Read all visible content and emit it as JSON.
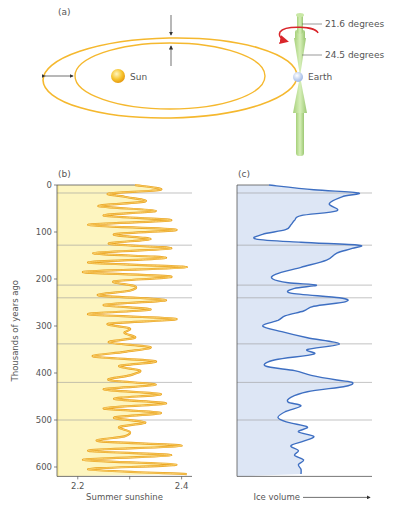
{
  "panel_a": {
    "label": "(a)",
    "sun_label": "Sun",
    "earth_label": "Earth",
    "tilt_max_label": "21.6 degrees",
    "tilt_min_label": "24.5 degrees",
    "colors": {
      "orbit": "#f5b82e",
      "sun": "#f7c530",
      "earth": "#c8d8f2",
      "axis": "#b6dc8c",
      "precession_arrow": "#d9252a"
    }
  },
  "panel_b": {
    "label": "(b)"
  },
  "panel_c": {
    "label": "(c)"
  },
  "chart_data": [
    {
      "type": "line",
      "title": "(b) Summer sunshine",
      "xlabel": "Summer sunshine",
      "ylabel": "Thousands of years ago",
      "xticks": [
        "2.2",
        "2.4"
      ],
      "xlim": [
        2.16,
        2.42
      ],
      "yticks": [
        0,
        100,
        200,
        300,
        400,
        500,
        600
      ],
      "ylim": [
        0,
        620
      ],
      "y_inverted": true,
      "fill_color": "#fdf5c0",
      "line_color": "#f2b23a",
      "reference_lines_kyr": [
        17,
        128,
        213,
        240,
        338,
        420,
        500
      ],
      "series": [
        {
          "name": "Summer sunshine",
          "y": [
            0,
            10,
            18,
            25,
            35,
            45,
            55,
            65,
            75,
            85,
            95,
            105,
            115,
            125,
            135,
            145,
            155,
            165,
            175,
            185,
            195,
            205,
            215,
            225,
            235,
            245,
            255,
            265,
            275,
            285,
            295,
            305,
            315,
            325,
            335,
            345,
            355,
            365,
            375,
            385,
            395,
            405,
            415,
            425,
            435,
            445,
            455,
            465,
            475,
            485,
            495,
            505,
            515,
            525,
            535,
            545,
            555,
            565,
            575,
            585,
            595,
            605,
            615
          ],
          "x": [
            2.31,
            2.36,
            2.26,
            2.29,
            2.33,
            2.24,
            2.35,
            2.25,
            2.38,
            2.22,
            2.39,
            2.27,
            2.34,
            2.26,
            2.38,
            2.23,
            2.37,
            2.22,
            2.41,
            2.21,
            2.38,
            2.27,
            2.31,
            2.3,
            2.24,
            2.37,
            2.25,
            2.34,
            2.22,
            2.39,
            2.26,
            2.3,
            2.29,
            2.31,
            2.26,
            2.34,
            2.29,
            2.23,
            2.35,
            2.28,
            2.32,
            2.3,
            2.26,
            2.35,
            2.25,
            2.36,
            2.27,
            2.37,
            2.25,
            2.36,
            2.27,
            2.33,
            2.28,
            2.3,
            2.29,
            2.24,
            2.4,
            2.22,
            2.38,
            2.21,
            2.39,
            2.22,
            2.41
          ]
        }
      ]
    },
    {
      "type": "area",
      "title": "(c) Ice volume",
      "xlabel": "Ice volume",
      "ylabel": "Thousands of years ago",
      "y_inverted": true,
      "ylim": [
        0,
        620
      ],
      "fill_color": "#dde6f5",
      "line_color": "#3e6fc2",
      "reference_lines_kyr": [
        17,
        128,
        213,
        240,
        338,
        420,
        500
      ],
      "series": [
        {
          "name": "Ice volume (relative, 0-1)",
          "y": [
            0,
            10,
            17,
            25,
            40,
            55,
            65,
            75,
            85,
            95,
            105,
            115,
            122,
            128,
            135,
            145,
            160,
            175,
            190,
            200,
            208,
            213,
            220,
            230,
            240,
            248,
            258,
            268,
            278,
            288,
            300,
            312,
            325,
            338,
            350,
            360,
            372,
            385,
            395,
            405,
            415,
            420,
            428,
            440,
            452,
            462,
            470,
            482,
            495,
            505,
            515,
            525,
            535,
            545,
            555,
            565,
            575,
            585,
            595,
            605,
            615
          ],
          "x": [
            0.25,
            0.6,
            0.95,
            0.82,
            0.72,
            0.78,
            0.5,
            0.45,
            0.42,
            0.38,
            0.2,
            0.15,
            0.5,
            0.95,
            0.9,
            0.78,
            0.7,
            0.5,
            0.3,
            0.28,
            0.4,
            0.62,
            0.45,
            0.42,
            0.8,
            0.85,
            0.6,
            0.52,
            0.38,
            0.32,
            0.2,
            0.35,
            0.55,
            0.8,
            0.55,
            0.6,
            0.3,
            0.22,
            0.45,
            0.58,
            0.78,
            0.9,
            0.85,
            0.55,
            0.42,
            0.4,
            0.5,
            0.38,
            0.32,
            0.4,
            0.55,
            0.48,
            0.6,
            0.52,
            0.42,
            0.48,
            0.45,
            0.52,
            0.48,
            0.5,
            0.5
          ]
        }
      ]
    }
  ]
}
